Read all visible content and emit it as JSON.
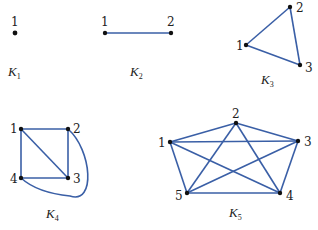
{
  "edge_color": "#3a5fa6",
  "graphs": [
    {
      "name": "K",
      "sub": "1",
      "vertices": [
        "1"
      ],
      "edges": []
    },
    {
      "name": "K",
      "sub": "2",
      "vertices": [
        "1",
        "2"
      ],
      "edges": [
        [
          "1",
          "2"
        ]
      ]
    },
    {
      "name": "K",
      "sub": "3",
      "vertices": [
        "1",
        "2",
        "3"
      ],
      "edges": [
        [
          "1",
          "2"
        ],
        [
          "2",
          "3"
        ],
        [
          "1",
          "3"
        ]
      ]
    },
    {
      "name": "K",
      "sub": "4",
      "vertices": [
        "1",
        "2",
        "3",
        "4"
      ],
      "edges": [
        [
          "1",
          "2"
        ],
        [
          "2",
          "3"
        ],
        [
          "3",
          "4"
        ],
        [
          "4",
          "1"
        ],
        [
          "1",
          "3"
        ],
        [
          "2",
          "4"
        ]
      ]
    },
    {
      "name": "K",
      "sub": "5",
      "vertices": [
        "1",
        "2",
        "3",
        "4",
        "5"
      ],
      "edges": [
        [
          "1",
          "2"
        ],
        [
          "1",
          "3"
        ],
        [
          "1",
          "4"
        ],
        [
          "1",
          "5"
        ],
        [
          "2",
          "3"
        ],
        [
          "2",
          "4"
        ],
        [
          "2",
          "5"
        ],
        [
          "3",
          "4"
        ],
        [
          "3",
          "5"
        ],
        [
          "4",
          "5"
        ]
      ]
    }
  ]
}
